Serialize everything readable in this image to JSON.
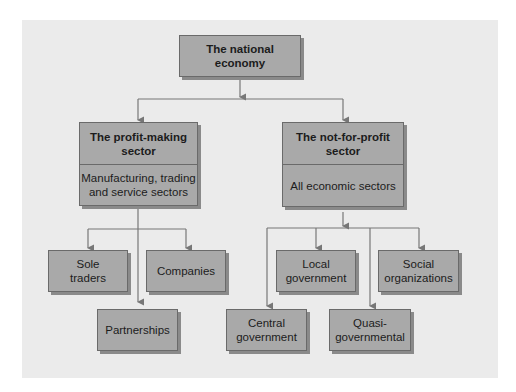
{
  "diagram": {
    "root": {
      "label": "The national economy"
    },
    "sectors": [
      {
        "title": "The profit-making\nsector",
        "description": "Manufacturing, trading\nand service sectors"
      },
      {
        "title": "The not-for-profit\nsector",
        "description": "All economic sectors"
      }
    ],
    "profit_children": [
      {
        "label": "Sole\ntraders"
      },
      {
        "label": "Companies"
      },
      {
        "label": "Partnerships"
      }
    ],
    "nonprofit_children": [
      {
        "label": "Local\ngovernment"
      },
      {
        "label": "Social\norganizations"
      },
      {
        "label": "Central\ngovernment"
      },
      {
        "label": "Quasi-\ngovernmental"
      }
    ],
    "colors": {
      "panel": "#ebebeb",
      "box": "#a9a9a9",
      "line": "#777777"
    }
  }
}
